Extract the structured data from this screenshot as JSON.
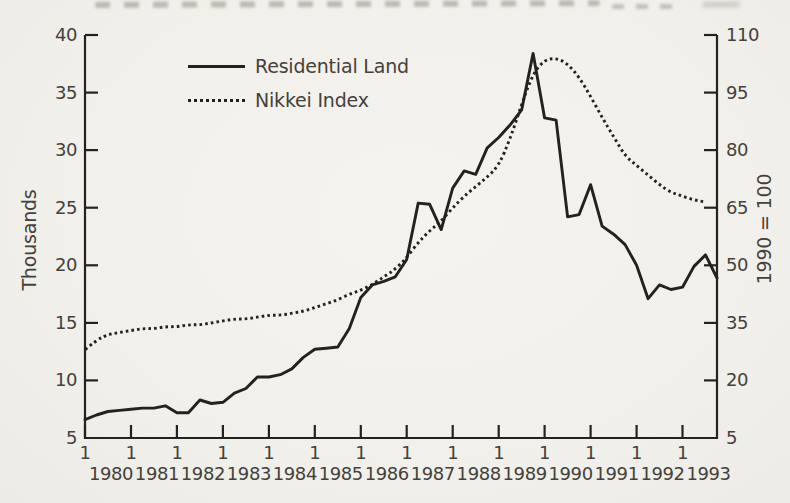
{
  "figure_kind": "scanned book line chart",
  "colors": {
    "line": "#23221e",
    "text": "#45413a",
    "paper": "#f1f0eb"
  },
  "legend": {
    "items": [
      {
        "label": "Residential Land",
        "style": "solid"
      },
      {
        "label": "Nikkei Index",
        "style": "dotted"
      }
    ]
  },
  "axes": {
    "left": {
      "title": "Thousands",
      "ticks": [
        "40",
        "35",
        "30",
        "25",
        "20",
        "15",
        "10",
        "5"
      ]
    },
    "right": {
      "title": "1990 = 100",
      "ticks": [
        "110",
        "95",
        "80",
        "65",
        "50",
        "35",
        "20",
        "5"
      ]
    },
    "x": {
      "quarter_marker": "1",
      "years": [
        "1980",
        "1981",
        "1982",
        "1983",
        "1984",
        "1985",
        "1986",
        "1987",
        "1988",
        "1989",
        "1990",
        "1991",
        "1992",
        "1993"
      ]
    }
  },
  "chart_data": {
    "type": "line",
    "title": "",
    "xlabel": "",
    "x": {
      "start": "1980-Q1",
      "end": "1993-Q4",
      "frequency": "quarterly",
      "values_per_year": 4
    },
    "left_axis": {
      "label": "Thousands",
      "range": [
        5,
        40
      ],
      "tick_step": 5
    },
    "right_axis": {
      "label": "1990 = 100",
      "range": [
        5,
        110
      ],
      "tick_step": 15
    },
    "grid": false,
    "legend_position": "upper-left-inside",
    "series": [
      {
        "name": "Residential Land",
        "axis": "left",
        "line_style": "solid",
        "values": [
          6.6,
          7.0,
          7.3,
          7.4,
          7.5,
          7.6,
          7.6,
          7.8,
          7.2,
          7.2,
          8.3,
          8.0,
          8.1,
          8.9,
          9.3,
          10.3,
          10.3,
          10.5,
          11.0,
          12.0,
          12.7,
          12.8,
          12.9,
          14.5,
          17.2,
          18.3,
          18.6,
          19.0,
          20.5,
          25.4,
          25.3,
          23.1,
          26.7,
          28.2,
          27.9,
          30.2,
          31.1,
          32.2,
          33.5,
          38.4,
          32.8,
          32.6,
          24.2,
          24.4,
          27.0,
          23.4,
          22.7,
          21.8,
          20.0,
          17.1,
          18.3,
          17.9,
          18.1,
          19.9,
          20.9,
          18.9
        ]
      },
      {
        "name": "Nikkei Index",
        "axis": "right",
        "line_style": "dotted",
        "values": [
          28,
          30.5,
          32,
          32.5,
          33,
          33.5,
          33.5,
          34,
          34,
          34.5,
          34.5,
          35,
          35.5,
          36,
          36,
          36.5,
          37,
          37,
          37.5,
          38,
          39,
          40,
          41,
          42.5,
          43.5,
          45,
          47,
          49,
          52,
          56,
          59,
          61.5,
          65,
          68,
          70.5,
          73,
          76,
          83,
          92,
          100,
          103.5,
          104,
          102.5,
          99,
          94,
          88.5,
          83.5,
          78.5,
          76,
          73.5,
          71,
          69,
          68,
          67,
          66.5
        ]
      }
    ]
  }
}
